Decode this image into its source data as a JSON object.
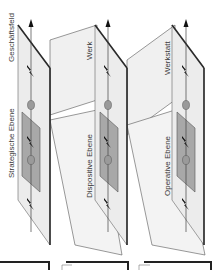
{
  "diagram": {
    "orientation": "rotated-90-ccw",
    "levels": [
      {
        "id": "strategic",
        "level_label": "Strategische Ebene",
        "scope_label": "Geschäftsfeld"
      },
      {
        "id": "dispositive",
        "level_label": "Dispositive Ebene",
        "scope_label": "Werk"
      },
      {
        "id": "operative",
        "level_label": "Operative Ebene",
        "scope_label": "Werkstatt"
      }
    ],
    "icons": {
      "arrow": "arrow-up-icon",
      "disturbance": "lightning-bolt-icon",
      "node": "ellipse-node-icon"
    },
    "colors": {
      "plane_fill": "#ececec",
      "plane_edge": "#2a2a2a",
      "inner_panel": "#a8a8a8",
      "node": "#9a9a9a",
      "line": "#555555"
    }
  }
}
